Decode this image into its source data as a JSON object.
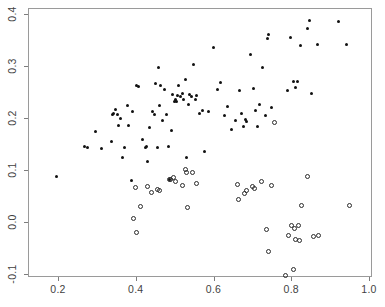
{
  "chart_data": {
    "type": "scatter",
    "title": "",
    "xlabel": "",
    "ylabel": "",
    "xlim": [
      0.15,
      1.02
    ],
    "ylim": [
      -0.135,
      0.415
    ],
    "grid": false,
    "legend": "none",
    "xticks": [
      0.2,
      0.4,
      0.6,
      0.8,
      1.0
    ],
    "xtick_labels": [
      "0.2",
      "0.4",
      "0.6",
      "0.8",
      "1.0"
    ],
    "yticks": [
      -0.1,
      0.0,
      0.1,
      0.2,
      0.3,
      0.4
    ],
    "ytick_labels": [
      "-0.1",
      "0.0",
      "0.1",
      "0.2",
      "0.3",
      "0.4"
    ],
    "series": [
      {
        "name": "filled-points",
        "marker": "filled-circle",
        "color": "#111111",
        "points": [
          [
            0.196,
            0.087
          ],
          [
            0.269,
            0.146
          ],
          [
            0.276,
            0.144
          ],
          [
            0.296,
            0.174
          ],
          [
            0.311,
            0.142
          ],
          [
            0.337,
            0.154
          ],
          [
            0.341,
            0.206
          ],
          [
            0.344,
            0.209
          ],
          [
            0.348,
            0.216
          ],
          [
            0.352,
            0.207
          ],
          [
            0.356,
            0.186
          ],
          [
            0.362,
            0.199
          ],
          [
            0.366,
            0.124
          ],
          [
            0.371,
            0.143
          ],
          [
            0.378,
            0.224
          ],
          [
            0.381,
            0.185
          ],
          [
            0.388,
            0.08
          ],
          [
            0.392,
            0.212
          ],
          [
            0.401,
            0.263
          ],
          [
            0.406,
            0.26
          ],
          [
            0.417,
            0.158
          ],
          [
            0.424,
            0.143
          ],
          [
            0.427,
            0.146
          ],
          [
            0.431,
            0.117
          ],
          [
            0.436,
            0.182
          ],
          [
            0.443,
            0.212
          ],
          [
            0.447,
            0.207
          ],
          [
            0.452,
            0.266
          ],
          [
            0.455,
            0.143
          ],
          [
            0.458,
            0.297
          ],
          [
            0.461,
            0.224
          ],
          [
            0.464,
            0.262
          ],
          [
            0.468,
            0.196
          ],
          [
            0.473,
            0.254
          ],
          [
            0.478,
            0.206
          ],
          [
            0.483,
            0.145
          ],
          [
            0.487,
            0.081
          ],
          [
            0.492,
            0.176
          ],
          [
            0.495,
            0.246
          ],
          [
            0.499,
            0.232
          ],
          [
            0.502,
            0.236
          ],
          [
            0.505,
            0.231
          ],
          [
            0.508,
            0.244
          ],
          [
            0.511,
            0.262
          ],
          [
            0.515,
            0.241
          ],
          [
            0.519,
            0.247
          ],
          [
            0.523,
            0.236
          ],
          [
            0.527,
            0.274
          ],
          [
            0.531,
            0.124
          ],
          [
            0.535,
            0.226
          ],
          [
            0.539,
            0.245
          ],
          [
            0.544,
            0.241
          ],
          [
            0.549,
            0.302
          ],
          [
            0.553,
            0.236
          ],
          [
            0.557,
            0.244
          ],
          [
            0.563,
            0.208
          ],
          [
            0.571,
            0.214
          ],
          [
            0.578,
            0.135
          ],
          [
            0.586,
            0.212
          ],
          [
            0.601,
            0.336
          ],
          [
            0.611,
            0.254
          ],
          [
            0.619,
            0.268
          ],
          [
            0.628,
            0.204
          ],
          [
            0.637,
            0.223
          ],
          [
            0.646,
            0.178
          ],
          [
            0.656,
            0.196
          ],
          [
            0.667,
            0.252
          ],
          [
            0.673,
            0.208
          ],
          [
            0.678,
            0.183
          ],
          [
            0.682,
            0.198
          ],
          [
            0.686,
            0.194
          ],
          [
            0.694,
            0.322
          ],
          [
            0.702,
            0.257
          ],
          [
            0.707,
            0.215
          ],
          [
            0.712,
            0.184
          ],
          [
            0.718,
            0.226
          ],
          [
            0.727,
            0.297
          ],
          [
            0.733,
            0.205
          ],
          [
            0.738,
            0.353
          ],
          [
            0.741,
            0.361
          ],
          [
            0.748,
            0.22
          ],
          [
            0.791,
            0.253
          ],
          [
            0.799,
            0.355
          ],
          [
            0.806,
            0.271
          ],
          [
            0.812,
            0.258
          ],
          [
            0.817,
            0.271
          ],
          [
            0.824,
            0.34
          ],
          [
            0.843,
            0.372
          ],
          [
            0.848,
            0.387
          ],
          [
            0.853,
            0.247
          ],
          [
            0.867,
            0.342
          ],
          [
            0.921,
            0.386
          ],
          [
            0.941,
            0.341
          ]
        ]
      },
      {
        "name": "open-points",
        "marker": "open-circle",
        "color": "#2b2b2b",
        "points": [
          [
            0.393,
            0.006
          ],
          [
            0.399,
            0.067
          ],
          [
            0.402,
            -0.021
          ],
          [
            0.413,
            0.03
          ],
          [
            0.429,
            0.068
          ],
          [
            0.441,
            0.057
          ],
          [
            0.456,
            0.062
          ],
          [
            0.462,
            0.06
          ],
          [
            0.486,
            0.081
          ],
          [
            0.489,
            0.081
          ],
          [
            0.497,
            0.085
          ],
          [
            0.503,
            0.078
          ],
          [
            0.519,
            0.071
          ],
          [
            0.527,
            0.101
          ],
          [
            0.531,
            0.095
          ],
          [
            0.534,
            0.027
          ],
          [
            0.546,
            0.095
          ],
          [
            0.556,
            0.075
          ],
          [
            0.663,
            0.072
          ],
          [
            0.665,
            0.043
          ],
          [
            0.681,
            0.055
          ],
          [
            0.686,
            0.06
          ],
          [
            0.7,
            0.068
          ],
          [
            0.706,
            0.064
          ],
          [
            0.723,
            0.078
          ],
          [
            0.737,
            -0.014
          ],
          [
            0.741,
            -0.056
          ],
          [
            0.749,
            0.071
          ],
          [
            0.758,
            0.192
          ],
          [
            0.786,
            -0.103
          ],
          [
            0.793,
            -0.026
          ],
          [
            0.8,
            -0.007
          ],
          [
            0.806,
            -0.091
          ],
          [
            0.809,
            -0.012
          ],
          [
            0.812,
            -0.033
          ],
          [
            0.818,
            -0.006
          ],
          [
            0.821,
            -0.035
          ],
          [
            0.826,
            0.031
          ],
          [
            0.842,
            0.088
          ],
          [
            0.858,
            -0.027
          ],
          [
            0.871,
            -0.026
          ],
          [
            0.95,
            0.031
          ]
        ]
      }
    ]
  },
  "axes": {
    "left_px": 28,
    "top_px": 8,
    "right_px": 372,
    "bottom_px": 277,
    "x_px_per_unit": 388.75,
    "x_origin_value": 0.2,
    "x_origin_px": 58,
    "y_px_per_unit": 520,
    "y_origin_value": 0.4,
    "y_origin_px": 14
  }
}
